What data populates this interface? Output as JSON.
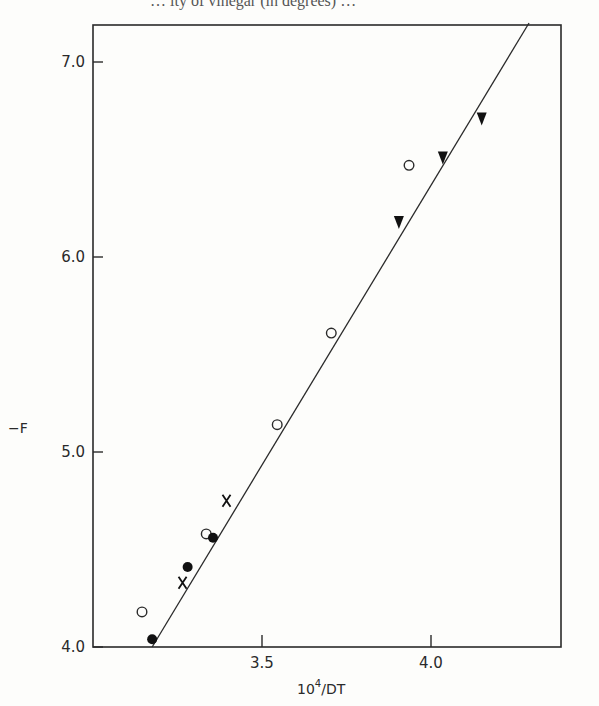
{
  "header_fragment": "… ity of vinegar (in degrees) …",
  "chart_data": {
    "type": "scatter",
    "title": "",
    "xlabel": "10^4/DT",
    "xlabel_base": "10",
    "xlabel_exp": "4",
    "xlabel_rest": "/DT",
    "ylabel": "−F",
    "xlim": [
      3.12,
      4.31
    ],
    "ylim": [
      4.0,
      7.2
    ],
    "xticks": [
      3.5,
      4.0
    ],
    "xtick_labels": [
      "3.5",
      "4.0"
    ],
    "yticks": [
      4.0,
      5.0,
      6.0,
      7.0
    ],
    "ytick_labels": [
      "4.0",
      "5.0",
      "6.0",
      "7.0"
    ],
    "grid": false,
    "legend": null,
    "fit_line": {
      "x": [
        3.175,
        4.29
      ],
      "y": [
        4.0,
        7.2
      ],
      "label": "linear fit"
    },
    "series": [
      {
        "name": "open circles",
        "marker": "open-circle",
        "x": [
          3.145,
          3.335,
          3.545,
          3.705,
          3.935
        ],
        "y": [
          4.18,
          4.58,
          5.14,
          5.61,
          6.47
        ]
      },
      {
        "name": "filled circles",
        "marker": "filled-circle",
        "x": [
          3.175,
          3.28,
          3.355
        ],
        "y": [
          4.04,
          4.41,
          4.56
        ]
      },
      {
        "name": "crosses",
        "marker": "cross",
        "x": [
          3.265,
          3.395
        ],
        "y": [
          4.33,
          4.75
        ]
      },
      {
        "name": "filled triangles",
        "marker": "filled-triangle-down",
        "x": [
          3.905,
          4.035,
          4.15
        ],
        "y": [
          6.18,
          6.51,
          6.71
        ]
      }
    ]
  },
  "colors": {
    "ink": "#2a2a2a",
    "paper": "#fdfdfb"
  }
}
